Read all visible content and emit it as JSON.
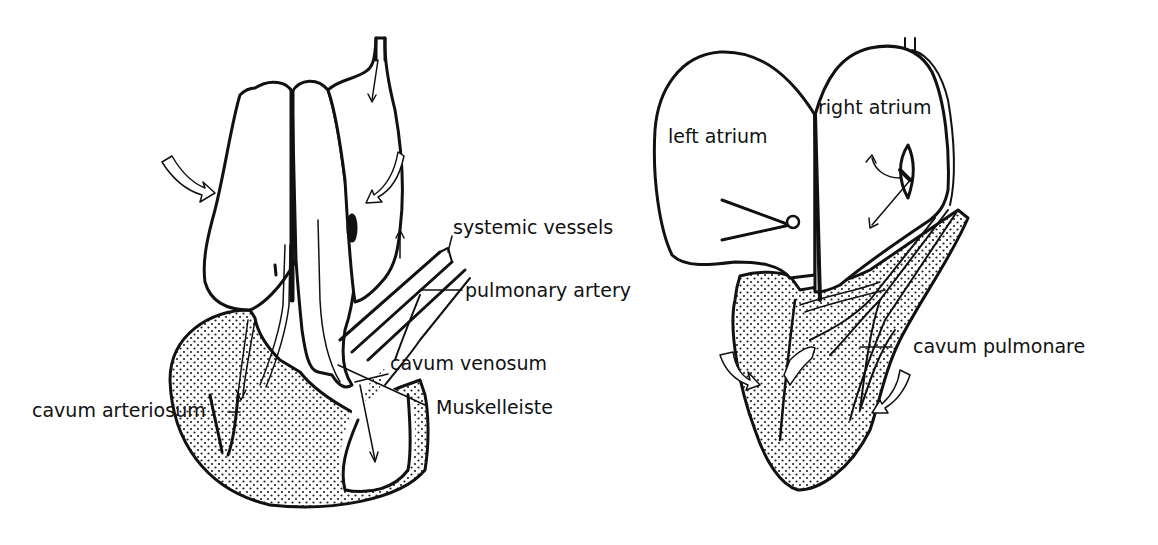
{
  "diagram": {
    "background": "#ffffff",
    "ink": "#111111",
    "left_heart": {
      "labels": {
        "systemic_vessels": "systemic vessels",
        "pulmonary_artery": "pulmonary artery",
        "cavum_venosum": "cavum venosum",
        "muskelleiste": "Muskelleiste",
        "cavum_arteriosum": "cavum arteriosum"
      }
    },
    "right_heart": {
      "labels": {
        "left_atrium": "left atrium",
        "right_atrium": "right atrium",
        "cavum_pulmonare": "cavum pulmonare"
      }
    }
  }
}
